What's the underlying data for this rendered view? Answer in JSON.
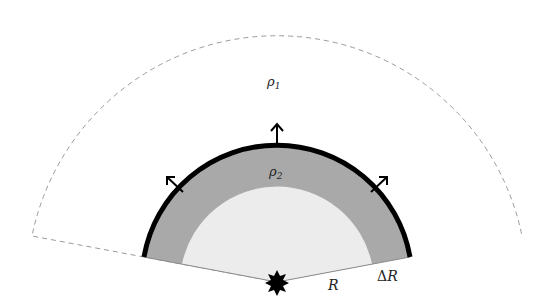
{
  "diagram": {
    "title": "",
    "labels": {
      "outer_density": "ρ",
      "outer_density_sub": "1",
      "shell_density": "ρ",
      "shell_density_sub": "2",
      "radius": "R",
      "shell_thickness_delta": "Δ",
      "shell_thickness_var": "R"
    },
    "colors": {
      "background": "#ffffff",
      "dashed_boundary": "#9a9a9a",
      "shell_fill": "#a9a9a9",
      "inner_fill": "#ececec",
      "shell_edge": "#000000",
      "radius_line": "#8a8a8a",
      "star": "#000000",
      "arrows": "#000000"
    },
    "geometry": {
      "center": [
        277,
        282
      ],
      "outer_radius": 255,
      "shell_outer_radius": 135,
      "inner_radius": 97,
      "half_angle_deg": 79.4
    },
    "elements": [
      "outer dashed sector (medium rho1)",
      "grey shell of thickness ΔR (medium rho2)",
      "thick black shock front",
      "three outward arrows",
      "central star source",
      "radius labels R and ΔR"
    ]
  }
}
